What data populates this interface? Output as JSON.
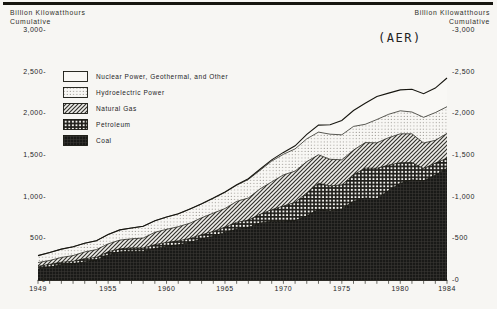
{
  "header": {
    "left_unit_line1": "Billion Kilowatthours",
    "left_unit_line2": "Cumulative",
    "right_unit_line1": "Billion Kilowatthours",
    "right_unit_line2": "Cumulative",
    "source_tag": "(AER)"
  },
  "colors": {
    "ink": "#16150f",
    "paper": "#f7f6f3"
  },
  "chart_data": {
    "type": "area",
    "stacked": true,
    "title": "",
    "ylabel": "Billion Kilowatthours Cumulative",
    "xlabel": "",
    "grid": false,
    "legend_position": "upper-left-inside",
    "ylim": [
      0,
      3000
    ],
    "ytick_step": 500,
    "ytick_labels": [
      "0",
      "500",
      "1,000",
      "1,500",
      "2,000",
      "2,500",
      "3,000"
    ],
    "xticks_labeled": [
      1949,
      1955,
      1960,
      1965,
      1970,
      1975,
      1980,
      1984
    ],
    "x": [
      1949,
      1950,
      1951,
      1952,
      1953,
      1954,
      1955,
      1956,
      1957,
      1958,
      1959,
      1960,
      1961,
      1962,
      1963,
      1964,
      1965,
      1966,
      1967,
      1968,
      1969,
      1970,
      1971,
      1972,
      1973,
      1974,
      1975,
      1976,
      1977,
      1978,
      1979,
      1980,
      1981,
      1982,
      1983,
      1984
    ],
    "series": [
      {
        "name": "Coal",
        "pattern": "coal",
        "values": [
          135,
          155,
          185,
          195,
          219,
          239,
          301,
          339,
          346,
          344,
          378,
          403,
          422,
          450,
          494,
          526,
          571,
          613,
          630,
          685,
          706,
          704,
          713,
          771,
          848,
          828,
          853,
          944,
          985,
          976,
          1075,
          1162,
          1203,
          1192,
          1259,
          1342
        ]
      },
      {
        "name": "Petroleum",
        "pattern": "petroleum",
        "values": [
          30,
          34,
          29,
          30,
          38,
          32,
          37,
          36,
          40,
          40,
          47,
          48,
          49,
          48,
          50,
          57,
          65,
          79,
          89,
          104,
          138,
          184,
          220,
          274,
          314,
          301,
          289,
          320,
          358,
          365,
          304,
          246,
          206,
          147,
          144,
          120
        ]
      },
      {
        "name": "Natural Gas",
        "pattern": "natural-gas",
        "values": [
          45,
          45,
          57,
          68,
          80,
          94,
          95,
          104,
          108,
          120,
          147,
          158,
          169,
          184,
          202,
          220,
          222,
          251,
          265,
          304,
          333,
          373,
          374,
          376,
          341,
          320,
          300,
          295,
          306,
          305,
          329,
          346,
          346,
          305,
          274,
          297
        ]
      },
      {
        "name": "Hydroelectric Power",
        "pattern": "hydro",
        "values": [
          83,
          96,
          100,
          105,
          105,
          107,
          113,
          122,
          130,
          140,
          138,
          146,
          152,
          169,
          166,
          177,
          194,
          195,
          222,
          222,
          250,
          248,
          266,
          273,
          272,
          301,
          300,
          284,
          220,
          280,
          280,
          276,
          261,
          309,
          332,
          321
        ]
      },
      {
        "name": "Nuclear Power, Geothermal, and Other",
        "pattern": "nuclear",
        "values": [
          0,
          0,
          0,
          0,
          0,
          0,
          0,
          0,
          0,
          0,
          0,
          1,
          2,
          2,
          3,
          3,
          4,
          6,
          8,
          13,
          14,
          22,
          38,
          54,
          84,
          114,
          173,
          191,
          251,
          276,
          255,
          251,
          273,
          283,
          294,
          344
        ]
      }
    ]
  }
}
